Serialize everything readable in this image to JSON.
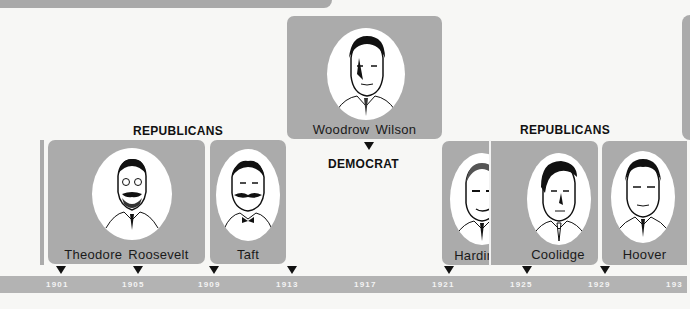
{
  "parties": [
    {
      "label": "REPUBLICANS",
      "group": "left"
    },
    {
      "label": "DEMOCRAT",
      "group": "center"
    },
    {
      "label": "REPUBLICANS",
      "group": "right"
    }
  ],
  "presidents": [
    {
      "name": "Theodore Roosevelt",
      "party": "Republican",
      "start": "1901",
      "end": "1909"
    },
    {
      "name": "Taft",
      "party": "Republican",
      "start": "1909",
      "end": "1913"
    },
    {
      "name": "Woodrow Wilson",
      "party": "Democrat",
      "start": "1913",
      "end": "1921"
    },
    {
      "name": "Harding",
      "party": "Republican",
      "start": "1921",
      "end": "1923"
    },
    {
      "name": "Coolidge",
      "party": "Republican",
      "start": "1923",
      "end": "1929"
    },
    {
      "name": "Hoover",
      "party": "Republican",
      "start": "1929",
      "end": "1933"
    }
  ],
  "timeline": {
    "years": [
      "1901",
      "1905",
      "1909",
      "1913",
      "1917",
      "1921",
      "1925",
      "1929",
      "1933"
    ],
    "visible_last": "193"
  },
  "colors": {
    "panel": "#ababab",
    "timeline": "#b3b3b3",
    "background": "#f7f7f5",
    "text": "#111111"
  }
}
